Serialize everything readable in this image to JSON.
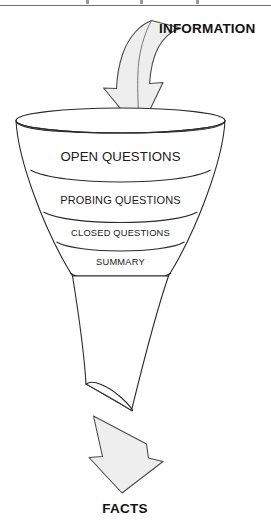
{
  "document": {
    "title": "Questioning Funnel",
    "background_color": "#ffffff",
    "page_rule_color": "#6e6e6e"
  },
  "diagram": {
    "type": "funnel",
    "orientation": "vertical",
    "input_label": "INFORMATION",
    "output_label": "FACTS",
    "stage_count": 4,
    "stages": [
      {
        "label": "OPEN QUESTIONS",
        "order": 1,
        "size": "major"
      },
      {
        "label": "PROBING QUESTIONS",
        "order": 2,
        "size": "mid"
      },
      {
        "label": "CLOSED QUESTIONS",
        "order": 3,
        "size": "small"
      },
      {
        "label": "SUMMARY",
        "order": 4,
        "size": "small"
      }
    ],
    "colors": {
      "outline": "#2b2b2b",
      "arrow_fill": "#eeeeee",
      "arrow_stroke": "#4a4a4a",
      "text": "#1a1a1a"
    },
    "icons": {
      "input_arrow": "curved-down-arrow-icon",
      "output_arrow": "down-arrow-icon"
    }
  }
}
